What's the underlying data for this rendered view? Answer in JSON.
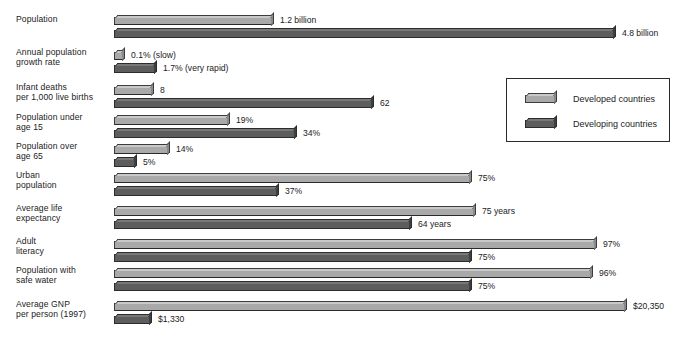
{
  "chart_data": {
    "type": "bar",
    "orientation": "horizontal",
    "title": "",
    "xlabel": "",
    "ylabel": "",
    "grid": false,
    "legend_position": "upper-right-inset",
    "legend": [
      "Developed countries",
      "Developing countries"
    ],
    "categories": [
      "Population",
      "Annual population\ngrowth rate",
      "Infant deaths\nper 1,000 live births",
      "Population under\nage 15",
      "Population over\nage 65",
      "Urban\npopulation",
      "Average life\nexpectancy",
      "Adult\nliteracy",
      "Population with\nsafe water",
      "Average GNP\nper person (1997)"
    ],
    "series": [
      {
        "name": "Developed countries",
        "color": "#a9a9a9",
        "labels": [
          "1.2 billion",
          "0.1% (slow)",
          "8",
          "19%",
          "14%",
          "75%",
          "75 years",
          "97%",
          "96%",
          "$20,350"
        ],
        "values": [
          1.2,
          0.1,
          8,
          19,
          14,
          75,
          75,
          97,
          96,
          20350
        ],
        "units": [
          "billion people",
          "percent per year",
          "deaths per 1,000 live births",
          "percent",
          "percent",
          "percent",
          "years",
          "percent",
          "percent",
          "US dollars"
        ]
      },
      {
        "name": "Developing countries",
        "color": "#5d5d5d",
        "labels": [
          "4.8 billion",
          "1.7% (very rapid)",
          "62",
          "34%",
          "5%",
          "37%",
          "64 years",
          "75%",
          "75%",
          "$1,330"
        ],
        "values": [
          4.8,
          1.7,
          62,
          34,
          5,
          37,
          64,
          75,
          75,
          1330
        ],
        "units": [
          "billion people",
          "percent per year",
          "deaths per 1,000 live births",
          "percent",
          "percent",
          "percent",
          "years",
          "percent",
          "percent",
          "US dollars"
        ]
      }
    ],
    "rows": [
      {
        "category": "Population",
        "developed": {
          "label": "1.2 billion",
          "value": 1.2,
          "bar_px": 158
        },
        "developing": {
          "label": "4.8 billion",
          "value": 4.8,
          "bar_px": 500
        }
      },
      {
        "category": "Annual population\ngrowth rate",
        "developed": {
          "label": "0.1% (slow)",
          "value": 0.1,
          "bar_px": 9
        },
        "developing": {
          "label": "1.7% (very rapid)",
          "value": 1.7,
          "bar_px": 41
        }
      },
      {
        "category": "Infant deaths\nper 1,000 live births",
        "developed": {
          "label": "8",
          "value": 8,
          "bar_px": 38
        },
        "developing": {
          "label": "62",
          "value": 62,
          "bar_px": 258
        }
      },
      {
        "category": "Population under\nage 15",
        "developed": {
          "label": "19%",
          "value": 19,
          "bar_px": 114
        },
        "developing": {
          "label": "34%",
          "value": 34,
          "bar_px": 181
        }
      },
      {
        "category": "Population over\nage 65",
        "developed": {
          "label": "14%",
          "value": 14,
          "bar_px": 54
        },
        "developing": {
          "label": "5%",
          "value": 5,
          "bar_px": 21
        }
      },
      {
        "category": "Urban\npopulation",
        "developed": {
          "label": "75%",
          "value": 75,
          "bar_px": 356
        },
        "developing": {
          "label": "37%",
          "value": 37,
          "bar_px": 163
        }
      },
      {
        "category": "Average life\nexpectancy",
        "developed": {
          "label": "75 years",
          "value": 75,
          "bar_px": 360
        },
        "developing": {
          "label": "64 years",
          "value": 64,
          "bar_px": 296
        }
      },
      {
        "category": "Adult\nliteracy",
        "developed": {
          "label": "97%",
          "value": 97,
          "bar_px": 481
        },
        "developing": {
          "label": "75%",
          "value": 75,
          "bar_px": 356
        }
      },
      {
        "category": "Population with\nsafe water",
        "developed": {
          "label": "96%",
          "value": 96,
          "bar_px": 477
        },
        "developing": {
          "label": "75%",
          "value": 75,
          "bar_px": 356
        }
      },
      {
        "category": "Average GNP\nper person (1997)",
        "developed": {
          "label": "$20,350",
          "value": 20350,
          "bar_px": 511
        },
        "developing": {
          "label": "$1,330",
          "value": 1330,
          "bar_px": 36
        }
      }
    ]
  }
}
